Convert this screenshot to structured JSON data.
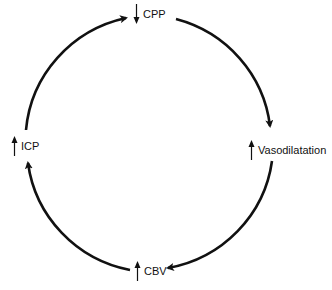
{
  "diagram": {
    "type": "cycle",
    "colors": {
      "stroke": "#111111",
      "background": "#ffffff",
      "text": "#111111"
    },
    "nodes": [
      {
        "id": "cpp",
        "label": "CPP",
        "direction": "down",
        "position": "top"
      },
      {
        "id": "vasodilatation",
        "label": "Vasodilatation",
        "direction": "up",
        "position": "right"
      },
      {
        "id": "cbv",
        "label": "CBV",
        "direction": "up",
        "position": "bottom"
      },
      {
        "id": "icp",
        "label": "ICP",
        "direction": "up",
        "position": "left"
      }
    ],
    "edges": [
      {
        "from": "cpp",
        "to": "vasodilatation"
      },
      {
        "from": "vasodilatation",
        "to": "cbv"
      },
      {
        "from": "cbv",
        "to": "icp"
      },
      {
        "from": "icp",
        "to": "cpp"
      }
    ]
  }
}
